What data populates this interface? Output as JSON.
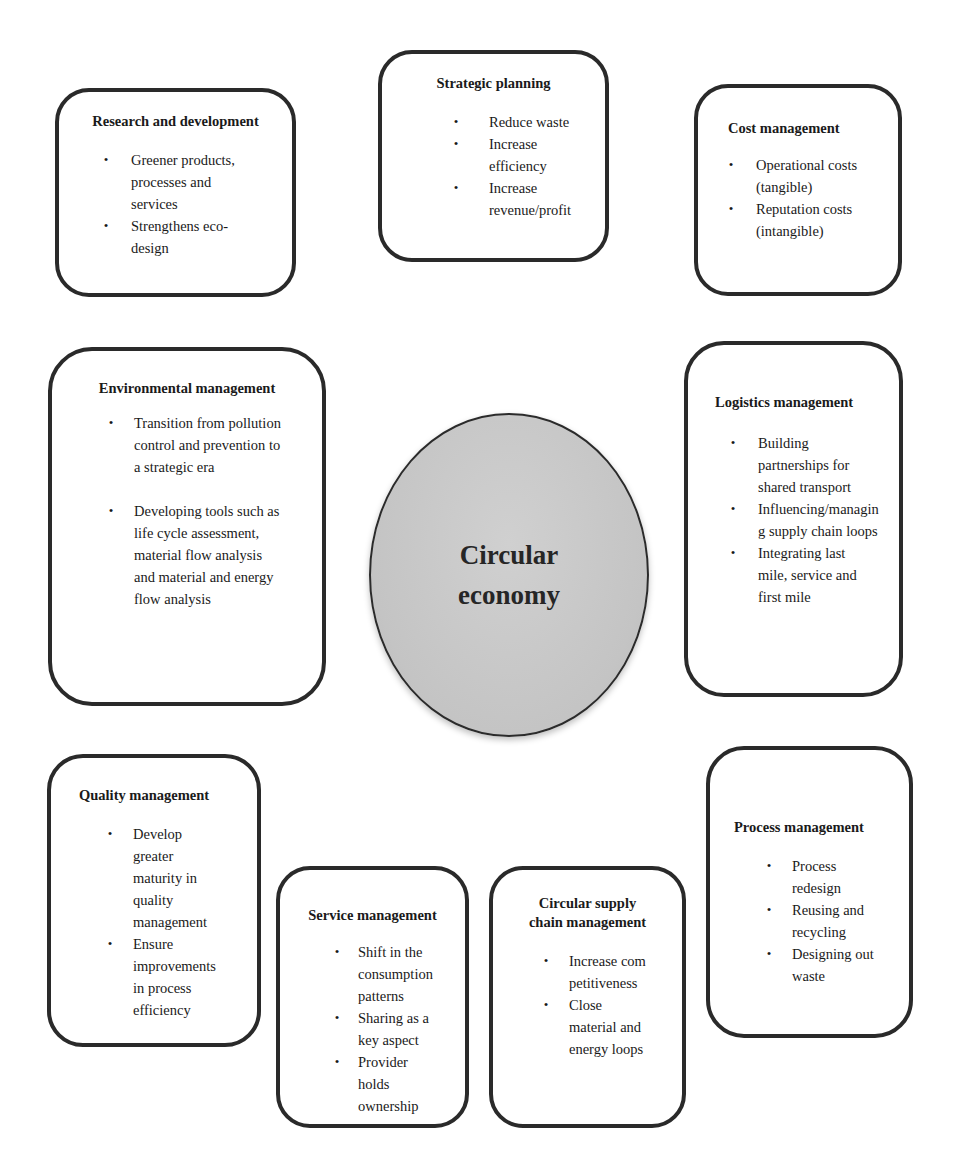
{
  "center": {
    "label_line1": "Circular",
    "label_line2": "economy",
    "fill_color": "#c4c4c4"
  },
  "boxes": {
    "strategic_planning": {
      "title": "Strategic planning",
      "items": [
        "Reduce waste",
        "Increase efficiency",
        "Increase revenue/profit"
      ]
    },
    "research_development": {
      "title": "Research and development",
      "items": [
        "Greener products, processes and services",
        "Strengthens eco-design"
      ]
    },
    "cost_management": {
      "title": "Cost management",
      "items": [
        "Operational costs (tangible)",
        "Reputation costs (intangible)"
      ]
    },
    "environmental_management": {
      "title": "Environmental management",
      "items": [
        "Transition from pollution control and prevention to a strategic era",
        "Developing tools such as life cycle assessment, material flow analysis and material and energy flow analysis"
      ]
    },
    "logistics_management": {
      "title": "Logistics management",
      "items": [
        "Building partnerships for shared transport",
        "Influencing/managing supply chain loops",
        "Integrating last mile, service and first mile"
      ]
    },
    "quality_management": {
      "title": "Quality management",
      "items": [
        "Develop greater maturity in quality management",
        "Ensure improvements in process efficiency"
      ]
    },
    "service_management": {
      "title": "Service management",
      "items": [
        "Shift in the consumption patterns",
        "Sharing as a key aspect",
        "Provider holds ownership"
      ]
    },
    "circular_supply_chain_management": {
      "title_line1": "Circular supply",
      "title_line2": "chain management",
      "items": [
        "Increase competitiveness",
        "Close material and energy loops"
      ]
    },
    "process_management": {
      "title": "Process management",
      "items": [
        "Process redesign",
        "Reusing and recycling",
        "Designing out waste"
      ]
    }
  },
  "icons": {
    "bullet": "•"
  }
}
